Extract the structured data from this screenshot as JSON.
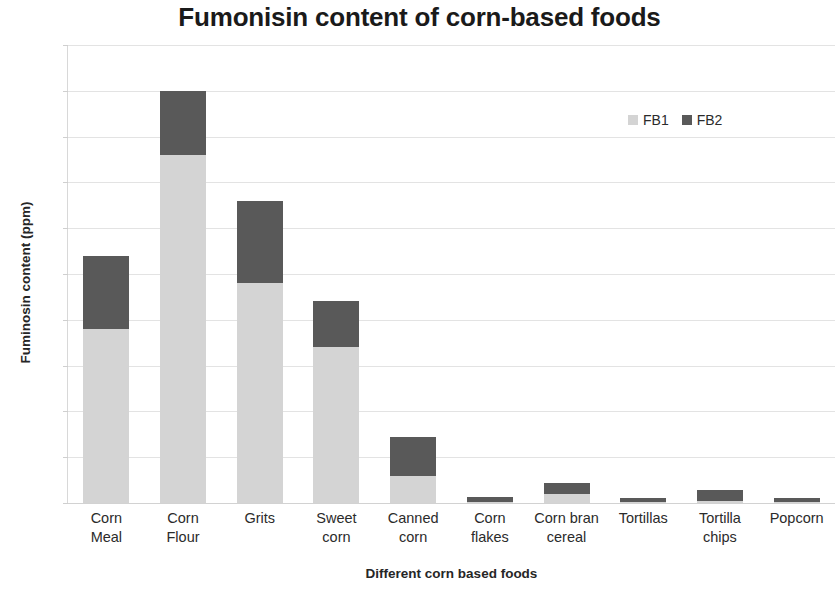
{
  "chart_data": {
    "type": "bar",
    "subtype": "stacked-bar",
    "title": "Fumonisin content of corn-based foods",
    "xlabel": "Different corn based foods",
    "ylabel": "Fuminosin content (ppm)",
    "ylim": [
      0,
      5
    ],
    "ytick_step": 0.5,
    "ytick_labels": [
      "5",
      "4.5",
      "4",
      "3.5",
      "3",
      "2.5",
      "2",
      "1.5",
      "1",
      "0.5",
      "0"
    ],
    "ytick_values": [
      5,
      4.5,
      4,
      3.5,
      3,
      2.5,
      2,
      1.5,
      1,
      0.5,
      0
    ],
    "grid": "horizontal",
    "legend_position": "top-right",
    "categories": [
      "Corn Meal",
      "Corn Flour",
      "Grits",
      "Sweet corn",
      "Canned corn",
      "Corn flakes",
      "Corn bran cereal",
      "Tortillas",
      "Tortilla chips",
      "Popcorn"
    ],
    "category_lines": [
      [
        "Corn",
        "Meal"
      ],
      [
        "Corn",
        "Flour"
      ],
      [
        "Grits"
      ],
      [
        "Sweet",
        "corn"
      ],
      [
        "Canned",
        "corn"
      ],
      [
        "Corn",
        "flakes"
      ],
      [
        "Corn bran",
        "cereal"
      ],
      [
        "Tortillas"
      ],
      [
        "Tortilla",
        "chips"
      ],
      [
        "Popcorn"
      ]
    ],
    "series": [
      {
        "name": "FB1",
        "color": "#d4d4d4",
        "values": [
          1.9,
          3.8,
          2.4,
          1.7,
          0.3,
          0.01,
          0.1,
          0.01,
          0.02,
          0.01
        ]
      },
      {
        "name": "FB2",
        "color": "#595959",
        "values": [
          0.8,
          0.7,
          0.9,
          0.5,
          0.42,
          0.06,
          0.12,
          0.05,
          0.12,
          0.04
        ]
      }
    ],
    "totals": [
      2.7,
      4.5,
      3.3,
      2.2,
      0.72,
      0.07,
      0.22,
      0.06,
      0.14,
      0.05
    ]
  },
  "legend": {
    "entries": [
      {
        "label": "FB1",
        "color": "#d4d4d4"
      },
      {
        "label": "FB2",
        "color": "#595959"
      }
    ]
  }
}
